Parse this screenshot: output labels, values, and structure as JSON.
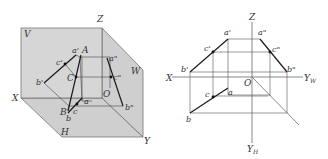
{
  "left_diagram": {
    "title": "Pictorial view of line AB in three-projection-plane system",
    "planes": {
      "V": "V",
      "W": "W",
      "H": "H"
    },
    "axes": {
      "X": "X",
      "Y": "Y",
      "Z": "Z",
      "O": "O"
    },
    "points_space": {
      "A": "A",
      "B": "B",
      "C": "C"
    },
    "projections": {
      "a_front": "a'",
      "b_front": "b'",
      "c_front": "c'",
      "a_side": "a\"",
      "b_side": "b\"",
      "c_side": "c\"",
      "a_top": "a",
      "b_top": "b",
      "c_top": "c"
    },
    "colors": {
      "plane_fill": "#d4d4d4",
      "plane_edge": "#555555",
      "line": "#222222"
    }
  },
  "right_diagram": {
    "title": "Orthographic projection of line AB",
    "axes": {
      "X": "X",
      "Z": "Z",
      "O": "O",
      "YW": "Y",
      "YW_sub": "W",
      "YH": "Y",
      "YH_sub": "H"
    },
    "projections": {
      "a_front": "a'",
      "b_front": "b'",
      "c_front": "c'",
      "a_side": "a\"",
      "b_side": "b\"",
      "c_side": "c\"",
      "a_top": "a",
      "b_top": "b",
      "c_top": "c"
    },
    "colors": {
      "line": "#222222",
      "construction": "#555555"
    }
  }
}
